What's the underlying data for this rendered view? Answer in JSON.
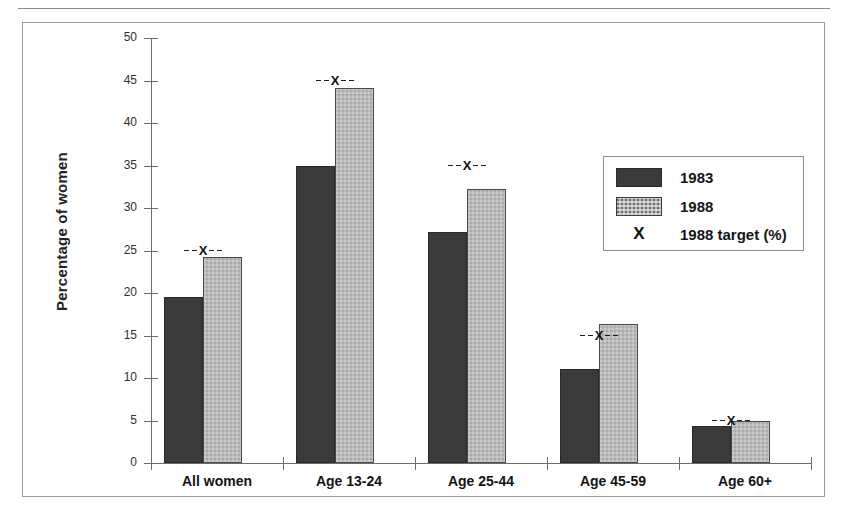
{
  "chart_data": {
    "type": "bar",
    "title": "",
    "xlabel": "",
    "ylabel": "Percentage of women",
    "ylim": [
      0,
      50
    ],
    "yticks": [
      0,
      5,
      10,
      15,
      20,
      25,
      30,
      35,
      40,
      45,
      50
    ],
    "ytick_labels": [
      "0",
      "5",
      "10",
      "15",
      "20",
      "25",
      "30",
      "35",
      "40",
      "45",
      "50"
    ],
    "grid": false,
    "legend_position": "right-inside",
    "categories": [
      "All women",
      "Age 13-24",
      "Age 25-44",
      "Age 45-59",
      "Age 60+"
    ],
    "series": [
      {
        "name": "1983",
        "values": [
          19.5,
          35.0,
          27.2,
          11.1,
          4.3
        ],
        "color": "#3a3a3a"
      },
      {
        "name": "1988",
        "values": [
          24.2,
          44.1,
          32.2,
          16.3,
          5.0
        ],
        "color": "#a9a9a9"
      }
    ],
    "markers": {
      "name": "1988 target (%)",
      "symbol": "X",
      "values": [
        25,
        45,
        35,
        15,
        5
      ]
    }
  },
  "legend": {
    "items": [
      {
        "label": "1983",
        "swatch": "solid-dark-swatch"
      },
      {
        "label": "1988",
        "swatch": "checkered-light-swatch"
      },
      {
        "label": "1988 target (%)",
        "swatch": "x-marker-glyph"
      }
    ]
  },
  "axis": {
    "y_title": "Percentage of women"
  }
}
